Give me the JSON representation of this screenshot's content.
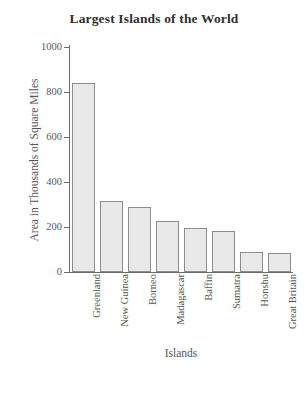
{
  "chart_data": {
    "type": "bar",
    "title": "Largest Islands of the World",
    "xlabel": "Islands",
    "ylabel": "Area in Thousands of Square Miles",
    "categories": [
      "Greenland",
      "New Guinea",
      "Borneo",
      "Madagascar",
      "Baffin",
      "Sumatra",
      "Honshu",
      "Great Britain"
    ],
    "values": [
      840,
      316,
      287,
      227,
      196,
      183,
      88,
      84
    ],
    "ylim": [
      0,
      1000
    ],
    "yticks": [
      0,
      200,
      400,
      600,
      800,
      1000
    ],
    "ytick_labels": [
      "0",
      "200",
      "400",
      "600",
      "800",
      "1000"
    ],
    "grid": false,
    "legend": false,
    "bar_fill": "#e9e9e9",
    "bar_border": "#8c8c8c",
    "axis_color": "#6b6b6b"
  }
}
